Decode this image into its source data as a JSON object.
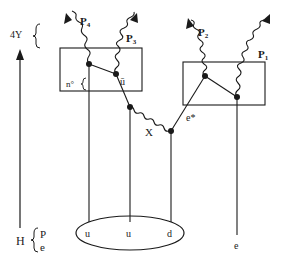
{
  "diagram": {
    "type": "feynman-diagram",
    "colors": {
      "ink": "#1a1a1a",
      "background": "#ffffff"
    },
    "axis": {
      "top_label": "4Y",
      "bottom_label": "H",
      "bottom_sub_top": "P",
      "bottom_sub_bottom": "e"
    },
    "photons": [
      {
        "id": "P4",
        "label": "P",
        "sub": "4"
      },
      {
        "id": "P3",
        "label": "P",
        "sub": "3"
      },
      {
        "id": "P2",
        "label": "P",
        "sub": "2"
      },
      {
        "id": "P1",
        "label": "P",
        "sub": "1"
      }
    ],
    "left_box": {
      "brace_label": "n°",
      "antiquark_label": "ū"
    },
    "exchange": {
      "label": "X"
    },
    "excited_electron": {
      "label": "e*"
    },
    "proton": {
      "quarks": [
        "u",
        "u",
        "d"
      ]
    },
    "electron": {
      "label": "e"
    }
  }
}
